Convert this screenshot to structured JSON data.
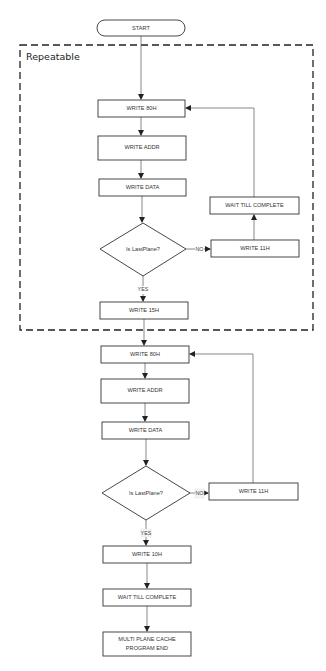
{
  "diagram": {
    "region": {
      "label": "Repeatable"
    },
    "nodes": {
      "start": "START",
      "r_write80": "WRITE 80H",
      "r_writeaddr": "WRITE ADDR",
      "r_writedata": "WRITE DATA",
      "r_decision": "Is LastPlane?",
      "r_write11": "WRITE 11H",
      "r_wait": "WAIT TILL COMPLETE",
      "r_write15": "WRITE 15H",
      "write80": "WRITE 80H",
      "writeaddr": "WRITE ADDR",
      "writedata": "WRITE DATA",
      "decision": "Is LastPlane?",
      "write11": "WRITE 11H",
      "write10": "WRITE 10H",
      "wait": "WAIT TILL COMPLETE",
      "end_line1": "MULTI PLANE CACHE",
      "end_line2": "PROGRAM END"
    },
    "edge_labels": {
      "r_no": "NO",
      "r_yes": "YES",
      "no": "NO",
      "yes": "YES"
    },
    "colors": {
      "stroke": "#333333",
      "edge": "#555555",
      "background": "#ffffff"
    }
  }
}
